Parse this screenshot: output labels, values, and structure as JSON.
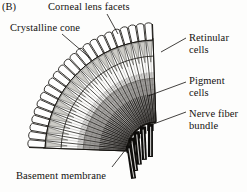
{
  "figure": {
    "panel_letter": "(B)",
    "background_color": "#fdfdfc",
    "ink_color": "#14120f"
  },
  "labels": {
    "corneal": "Corneal lens facets",
    "crystalline": "Crystalline cone",
    "retinular": "Retinular\ncells",
    "pigment": "Pigment\ncells",
    "nerve": "Nerve fiber\nbundle",
    "basement": "Basement membrane"
  },
  "leaders": {
    "corneal": {
      "x1": 107,
      "y1": 14,
      "x2": 118,
      "y2": 34
    },
    "crystalline": {
      "x1": 62,
      "y1": 34,
      "x2": 90,
      "y2": 58
    },
    "retinular": {
      "x1": 186,
      "y1": 38,
      "x2": 161,
      "y2": 52
    },
    "pigment": {
      "x1": 186,
      "y1": 82,
      "x2": 148,
      "y2": 96
    },
    "nerve": {
      "x1": 186,
      "y1": 112,
      "x2": 148,
      "y2": 126
    },
    "basement": {
      "x1": 112,
      "y1": 167,
      "x2": 133,
      "y2": 140
    }
  },
  "fan": {
    "apex_x": 157,
    "apex_y": 152,
    "angle_start_deg": 182,
    "angle_end_deg": 268,
    "ommatidia_count": 23,
    "radius_outer": 128,
    "radius_facet_inner": 112,
    "radius_cone_inner": 96,
    "radius_pigment_outer": 74,
    "radius_basement": 30,
    "facet_fill": "#fefefe",
    "cone_fill": "#b9b7b2",
    "pigment_fill": "#8e8c88",
    "stroke": "#15130f"
  },
  "nerve_bundles": {
    "count": 5,
    "color": "#0d0c0a",
    "highlight": "#f2f1ee",
    "length": 36,
    "width": 5
  },
  "structures": [
    {
      "name": "corneal-lens-facets",
      "region": "outer-arc"
    },
    {
      "name": "crystalline-cone",
      "region": "second-arc"
    },
    {
      "name": "retinular-cells",
      "region": "mid-radial"
    },
    {
      "name": "pigment-cells",
      "region": "inner-shaded"
    },
    {
      "name": "basement-membrane",
      "region": "apex-arc"
    },
    {
      "name": "nerve-fiber-bundle",
      "region": "below-apex"
    }
  ]
}
